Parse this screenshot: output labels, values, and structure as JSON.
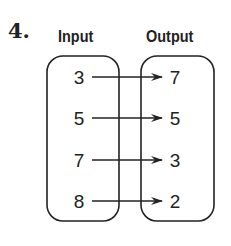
{
  "problem": {
    "number": "4."
  },
  "headers": {
    "input": "Input",
    "output": "Output"
  },
  "mapping": [
    {
      "input": "3",
      "output": "7"
    },
    {
      "input": "5",
      "output": "5"
    },
    {
      "input": "7",
      "output": "3"
    },
    {
      "input": "8",
      "output": "2"
    }
  ],
  "colors": {
    "stroke": "#222222",
    "background": "#ffffff"
  }
}
